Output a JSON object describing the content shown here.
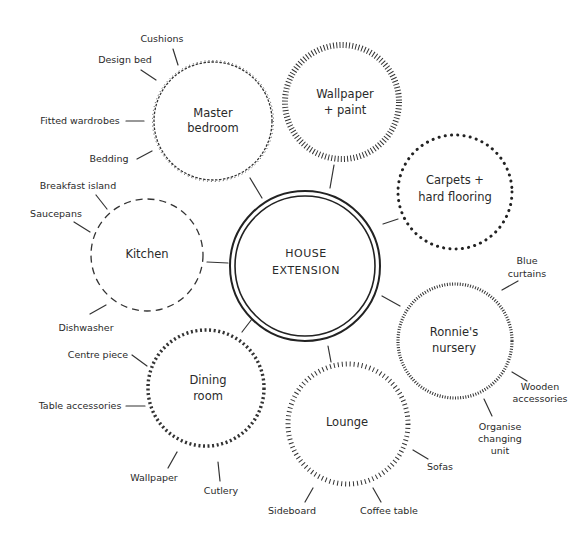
{
  "center": {
    "lines": [
      "HOUSE",
      "EXTENSION"
    ]
  },
  "nodes": {
    "master_bedroom": {
      "lines": [
        "Master",
        "bedroom"
      ],
      "items": [
        "Cushions",
        "Design bed",
        "Fitted wardrobes",
        "Bedding"
      ]
    },
    "wallpaper_paint": {
      "lines": [
        "Wallpaper",
        "+ paint"
      ],
      "items": []
    },
    "carpets": {
      "lines": [
        "Carpets +",
        "hard flooring"
      ],
      "items": []
    },
    "kitchen": {
      "lines": [
        "Kitchen"
      ],
      "items": [
        "Breakfast island",
        "Saucepans",
        "Dishwasher"
      ]
    },
    "nursery": {
      "lines": [
        "Ronnie's",
        "nursery"
      ],
      "items": [
        "Blue",
        "curtains",
        "Wooden",
        "accessories",
        "Organise",
        "changing",
        "unit"
      ]
    },
    "dining": {
      "lines": [
        "Dining",
        "room"
      ],
      "items": [
        "Centre piece",
        "Table accessories",
        "Wallpaper",
        "Cutlery"
      ]
    },
    "lounge": {
      "lines": [
        "Lounge"
      ],
      "items": [
        "Sofas",
        "Sideboard",
        "Coffee table"
      ]
    }
  },
  "colors": {
    "ink": "#2a2a2a",
    "background": "#ffffff"
  }
}
